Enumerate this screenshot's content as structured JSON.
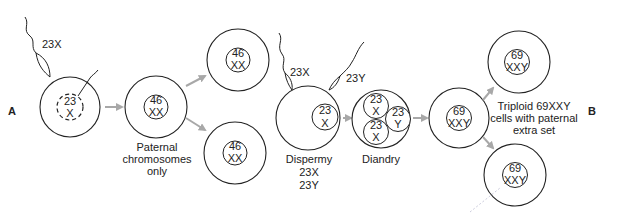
{
  "figure": {
    "panel_labels": {
      "left": "A",
      "right": "B"
    },
    "stage_a": {
      "fertilization": {
        "sperm_label": "23X",
        "egg_nucleus": {
          "line1": "23",
          "line2": "X",
          "style": "dashed"
        }
      },
      "zygote": {
        "line1": "46",
        "line2": "XX"
      },
      "caption": [
        "Paternal",
        "chromosomes",
        "only"
      ],
      "daughters": [
        {
          "line1": "46",
          "line2": "XX"
        },
        {
          "line1": "46",
          "line2": "XX"
        }
      ]
    },
    "stage_b": {
      "dispermy": {
        "sperm_labels": [
          "23X",
          "23Y"
        ],
        "egg_nucleus": {
          "line1": "23",
          "line2": "X"
        },
        "caption": [
          "Dispermy",
          "23X",
          "23Y"
        ]
      },
      "diandry": {
        "pronuclei": [
          {
            "line1": "23",
            "line2": "X"
          },
          {
            "line1": "23",
            "line2": "Y"
          },
          {
            "line1": "23",
            "line2": "X"
          }
        ],
        "caption": "Diandry"
      },
      "zygote": {
        "line1": "69",
        "line2": "XXY"
      },
      "caption": [
        "Triploid 69XXY",
        "cells with paternal",
        "extra set"
      ],
      "daughters": [
        {
          "line1": "69",
          "line2": "XXY"
        },
        {
          "line1": "69",
          "line2": "XXY"
        }
      ]
    },
    "colors": {
      "line": "#222222",
      "arrow": "#a8a8a8",
      "background": "#ffffff"
    }
  }
}
